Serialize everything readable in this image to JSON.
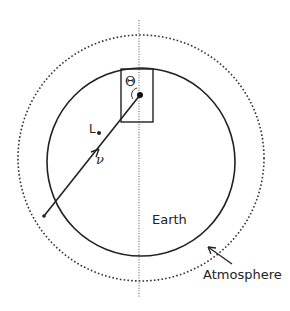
{
  "diagram": {
    "labels": {
      "earth": "Earth",
      "atmosphere": "Atmosphere",
      "theta": "Θ",
      "L": "L",
      "nu": "ν"
    },
    "elements": {
      "earth_circle": {
        "cx": 141,
        "cy": 162,
        "r": 94,
        "style": "solid"
      },
      "atmosphere_circle": {
        "cx": 141,
        "cy": 158,
        "r": 123,
        "style": "dotted"
      },
      "vertical_axis": {
        "x": 139,
        "y1": 20,
        "y2": 298,
        "style": "dotted"
      },
      "detector_box": {
        "x": 121,
        "y": 69,
        "width": 32,
        "height": 53
      },
      "detector_point": {
        "x": 140,
        "y": 95
      },
      "neutrino_track": {
        "x1": 44,
        "y1": 216,
        "x2": 140,
        "y2": 95
      },
      "atmosphere_pointer": {
        "x1": 232,
        "y1": 264,
        "x2": 207,
        "y2": 246
      }
    },
    "colors": {
      "line": "#222222",
      "background": "#ffffff"
    }
  }
}
